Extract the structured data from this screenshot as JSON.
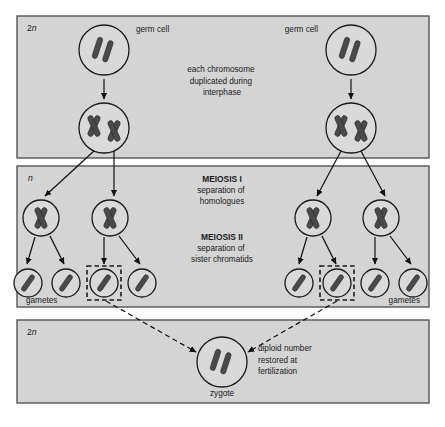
{
  "figure": {
    "panels": [
      {
        "id": "panel-diploid-top",
        "ploidy_label": "2n",
        "ploidy_prefix": "2",
        "ploidy_italic": "n",
        "caption_lines": [
          "each chromosome",
          "duplicated during",
          "interphase"
        ]
      },
      {
        "id": "panel-haploid-middle",
        "ploidy_label": "n",
        "ploidy_prefix": "",
        "ploidy_italic": "n",
        "meiosis_one_heading": "MEIOSIS I",
        "meiosis_one_lines": [
          "separation of",
          "homologues"
        ],
        "meiosis_two_heading": "MEIOSIS II",
        "meiosis_two_lines": [
          "separation of",
          "sister chromatids"
        ],
        "gametes_label_left": "gametes",
        "gametes_label_right": "gametes"
      },
      {
        "id": "panel-diploid-bottom",
        "ploidy_label": "2n",
        "ploidy_prefix": "2",
        "ploidy_italic": "n",
        "zygote_label": "zygote",
        "caption_lines": [
          "diploid number",
          "restored at",
          "fertilization"
        ]
      }
    ],
    "labels": {
      "germ_cell_left": "germ cell",
      "germ_cell_right": "germ cell"
    },
    "colors": {
      "panel_fill": "#d4d4d4",
      "panel_stroke": "#555555",
      "cell_fill": "#d9d9d9",
      "cell_stroke": "#1a1a1a",
      "chromosome": "#4a4a4a",
      "text": "#1a1a1a",
      "page_background": "#ffffff"
    },
    "cells": {
      "germ_cells": [
        {
          "name": "germ-cell-left",
          "cx": 104,
          "cy": 50,
          "r": 25,
          "chromosomes": "two-unduplicated-rods"
        },
        {
          "name": "germ-cell-right",
          "cx": 351,
          "cy": 50,
          "r": 25,
          "chromosomes": "two-unduplicated-rods"
        }
      ],
      "duplicated_cells": [
        {
          "name": "duplicated-cell-left",
          "cx": 104,
          "cy": 128,
          "r": 25,
          "chromosomes": "two-duplicated-x"
        },
        {
          "name": "duplicated-cell-right",
          "cx": 351,
          "cy": 128,
          "r": 25,
          "chromosomes": "two-duplicated-x"
        }
      ],
      "meiosis_one_products": [
        {
          "name": "meiosis-i-cell-1",
          "cx": 41,
          "cy": 218,
          "r": 18
        },
        {
          "name": "meiosis-i-cell-2",
          "cx": 110,
          "cy": 218,
          "r": 18
        },
        {
          "name": "meiosis-i-cell-3",
          "cx": 313,
          "cy": 218,
          "r": 18
        },
        {
          "name": "meiosis-i-cell-4",
          "cx": 381,
          "cy": 218,
          "r": 18
        }
      ],
      "gametes": [
        {
          "name": "gamete-1",
          "cx": 28,
          "cy": 283,
          "r": 14,
          "boxed": false
        },
        {
          "name": "gamete-2",
          "cx": 66,
          "cy": 283,
          "r": 14,
          "boxed": false
        },
        {
          "name": "gamete-3",
          "cx": 104,
          "cy": 283,
          "r": 14,
          "boxed": true
        },
        {
          "name": "gamete-4",
          "cx": 142,
          "cy": 283,
          "r": 14,
          "boxed": false
        },
        {
          "name": "gamete-5",
          "cx": 299,
          "cy": 283,
          "r": 14,
          "boxed": false
        },
        {
          "name": "gamete-6",
          "cx": 337,
          "cy": 283,
          "r": 14,
          "boxed": true
        },
        {
          "name": "gamete-7",
          "cx": 375,
          "cy": 283,
          "r": 14,
          "boxed": false
        },
        {
          "name": "gamete-8",
          "cx": 413,
          "cy": 283,
          "r": 14,
          "boxed": false
        }
      ],
      "zygote": {
        "name": "zygote-cell",
        "cx": 222,
        "cy": 362,
        "r": 25,
        "chromosomes": "two-unduplicated-rods"
      }
    }
  }
}
